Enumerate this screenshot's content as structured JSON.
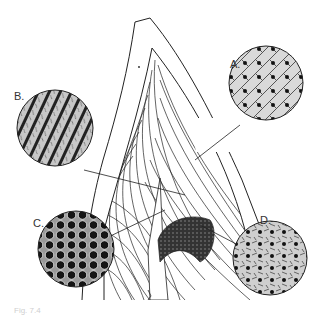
{
  "figure": {
    "type": "anatomical-line-drawing",
    "line_color": "#222222",
    "background": "#ffffff"
  },
  "insets": [
    {
      "id": "A",
      "label": "A.",
      "texture": "cells-with-dots"
    },
    {
      "id": "B",
      "label": "B.",
      "texture": "diagonal-rods"
    },
    {
      "id": "C",
      "label": "C.",
      "texture": "honeycomb-circles"
    },
    {
      "id": "D",
      "label": "D.",
      "texture": "speckled-dots"
    }
  ],
  "caption": {
    "text": "Fig. 7.4"
  }
}
